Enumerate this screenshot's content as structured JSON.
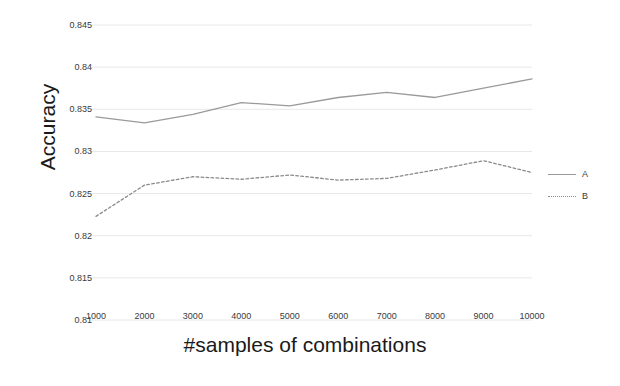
{
  "chart_data": {
    "type": "line",
    "title": "",
    "xlabel": "#samples of combinations",
    "ylabel": "Accuracy",
    "x": [
      1000,
      2000,
      3000,
      4000,
      5000,
      6000,
      7000,
      8000,
      9000,
      10000
    ],
    "xticklabels": [
      "1000",
      "2000",
      "3000",
      "4000",
      "5000",
      "6000",
      "7000",
      "8000",
      "9000",
      "10000"
    ],
    "yticks": [
      0.81,
      0.815,
      0.82,
      0.825,
      0.83,
      0.835,
      0.84,
      0.845
    ],
    "yticklabels": [
      "0.81",
      "0.815",
      "0.82",
      "0.825",
      "0.83",
      "0.835",
      "0.84",
      "0.845"
    ],
    "xlim": [
      1000,
      10000
    ],
    "ylim": [
      0.81,
      0.845
    ],
    "grid": true,
    "grid_axis": "y",
    "legend_position": "right",
    "series": [
      {
        "name": "A",
        "style": "solid",
        "color": "#9a9a9a",
        "values": [
          0.8341,
          0.8334,
          0.8344,
          0.8358,
          0.8354,
          0.8364,
          0.837,
          0.8364,
          0.8375,
          0.8386
        ]
      },
      {
        "name": "B",
        "style": "dotted",
        "color": "#8a8a8a",
        "values": [
          0.8223,
          0.826,
          0.827,
          0.8267,
          0.8272,
          0.8266,
          0.8268,
          0.8278,
          0.8289,
          0.8275
        ]
      }
    ]
  },
  "legend": {
    "items": [
      {
        "label": "A"
      },
      {
        "label": "B"
      }
    ]
  },
  "axes": {
    "y_title": "Accuracy",
    "x_title": "#samples of combinations"
  },
  "colors": {
    "series_a": "#9a9a9a",
    "series_b": "#8a8a8a",
    "grid": "#e8e8e8",
    "tick_text": "#3a3a3a",
    "title_text": "#1a1a1a",
    "background": "#ffffff"
  }
}
